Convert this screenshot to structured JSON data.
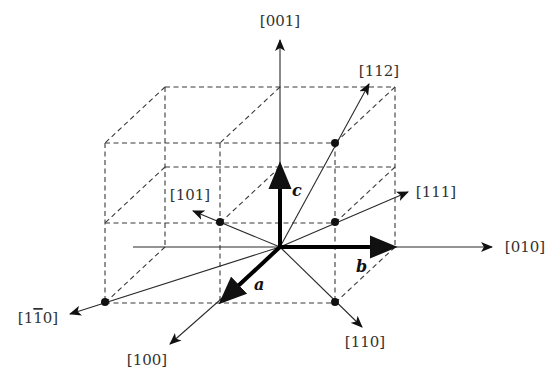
{
  "diagram": {
    "basis_vectors": {
      "a": "a",
      "b": "b",
      "c": "c"
    },
    "direction_labels": {
      "d001": "[001]",
      "d112": "[112]",
      "d101": "[101]",
      "d111": "[111]",
      "d010": "[010]",
      "d1m10": "[1̅0]",
      "d100": "[100]",
      "d110": "[110]"
    },
    "d1m10_parts": {
      "open": "[1",
      "bar1": "1",
      "rest": "0]"
    },
    "lattice_points": [
      "[101]",
      "[111]",
      "[112]",
      "[110]",
      "[1̅0]"
    ],
    "colors": {
      "line": "#2a2a2a",
      "dashed": "#3a3a3a",
      "vector": "#000000",
      "label": "#333333"
    }
  }
}
